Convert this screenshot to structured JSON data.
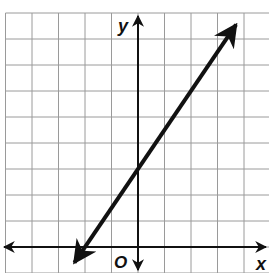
{
  "chart_data": {
    "type": "line",
    "title": "",
    "xlabel": "x",
    "ylabel": "y",
    "origin_label": "O",
    "grid": true,
    "xlim": [
      -5,
      5
    ],
    "ylim": [
      -1,
      9
    ],
    "series": [
      {
        "name": "line",
        "equation": "y = 1.5x + 3",
        "slope": 1.5,
        "y_intercept": 3,
        "x_intercept": -2,
        "x": [
          -2.4,
          -2,
          0,
          2,
          3.7
        ],
        "y": [
          -0.6,
          0,
          3,
          6,
          8.55
        ],
        "arrows_both_ends": true
      }
    ]
  },
  "colors": {
    "grid": "#9a9a9a",
    "axes": "#111111",
    "line": "#111111",
    "background": "#ffffff"
  }
}
